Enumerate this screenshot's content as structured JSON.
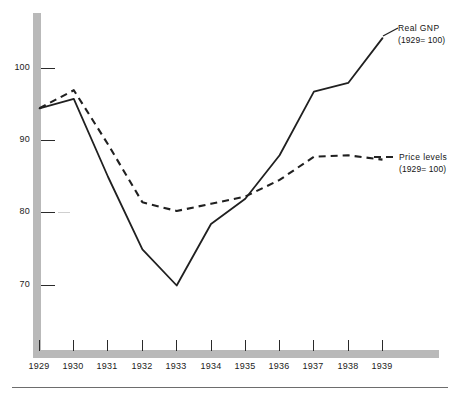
{
  "chart_data": {
    "type": "line",
    "title": "",
    "subtitle": "",
    "xlabel": "",
    "ylabel": "",
    "x": [
      1929,
      1930,
      1931,
      1932,
      1933,
      1934,
      1935,
      1936,
      1937,
      1938,
      1939
    ],
    "categories": [
      "1929",
      "1930",
      "1931",
      "1932",
      "1933",
      "1934",
      "1935",
      "1936",
      "1937",
      "1938",
      "1939"
    ],
    "ylim": [
      60,
      106
    ],
    "xlim": [
      1929,
      1939
    ],
    "y_ticks": [
      70,
      80,
      90,
      100
    ],
    "y_tick_labels": [
      "70",
      "80",
      "90",
      "100"
    ],
    "grid": false,
    "legend_position": "right-inline",
    "series": [
      {
        "name": "Real GNP",
        "label_line1": "Real  GNP",
        "label_line2": "(1929= 100)",
        "style": "solid",
        "color": "#202020",
        "values": [
          94.5,
          95.8,
          85.0,
          75.0,
          70.0,
          78.5,
          82.0,
          88.0,
          96.8,
          98.0,
          104.2
        ]
      },
      {
        "name": "Price levels",
        "label_line1": "Price levels",
        "label_line2": "(1929= 100)",
        "style": "dashed",
        "color": "#202020",
        "values": [
          94.5,
          97.0,
          89.5,
          81.5,
          80.3,
          81.3,
          82.3,
          84.6,
          87.8,
          88.0,
          87.4
        ]
      }
    ]
  },
  "axes": {
    "y_axis_bar_color": "#b8b8b8",
    "x_axis_bar_color": "#b8b8b8"
  }
}
